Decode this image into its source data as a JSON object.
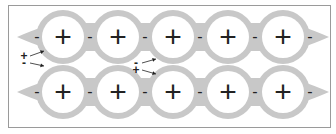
{
  "diagram": {
    "colors": {
      "background": "#ffffff",
      "frame": "#9a9a9a",
      "band": "#c8c8c8",
      "circle_fill": "#ffffff",
      "symbol": "#222222"
    },
    "chains": [
      {
        "name": "top-chain",
        "cy": 37,
        "cations": [
          {
            "x": 63,
            "label": "+"
          },
          {
            "x": 118,
            "label": "+"
          },
          {
            "x": 173,
            "label": "+"
          },
          {
            "x": 228,
            "label": "+"
          },
          {
            "x": 283,
            "label": "+"
          }
        ],
        "anions": [
          {
            "x": 37,
            "label": "-"
          },
          {
            "x": 90,
            "label": "-"
          },
          {
            "x": 145,
            "label": "-"
          },
          {
            "x": 200,
            "label": "-"
          },
          {
            "x": 255,
            "label": "-"
          },
          {
            "x": 310,
            "label": "-"
          }
        ]
      },
      {
        "name": "bottom-chain",
        "cy": 92,
        "cations": [
          {
            "x": 63,
            "label": "+"
          },
          {
            "x": 118,
            "label": "+"
          },
          {
            "x": 173,
            "label": "+"
          },
          {
            "x": 228,
            "label": "+"
          },
          {
            "x": 283,
            "label": "+"
          }
        ],
        "anions": [
          {
            "x": 37,
            "label": "-"
          },
          {
            "x": 90,
            "label": "-"
          },
          {
            "x": 145,
            "label": "-"
          },
          {
            "x": 200,
            "label": "-"
          },
          {
            "x": 255,
            "label": "-"
          },
          {
            "x": 310,
            "label": "-"
          }
        ]
      }
    ],
    "free_charges": [
      {
        "label": "+",
        "x": 24,
        "y": 56,
        "arrow_to": [
          44,
          51
        ]
      },
      {
        "label": "-",
        "x": 24,
        "y": 63,
        "arrow_to": [
          44,
          66
        ]
      },
      {
        "label": "-",
        "x": 136,
        "y": 63,
        "arrow_to": [
          156,
          59
        ]
      },
      {
        "label": "+",
        "x": 136,
        "y": 70,
        "arrow_to": [
          156,
          74
        ]
      }
    ]
  }
}
